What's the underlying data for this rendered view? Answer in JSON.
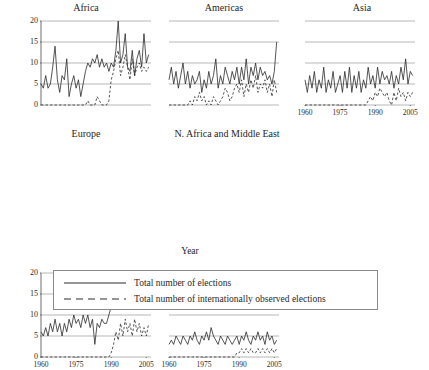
{
  "figure": {
    "xlabel": "Year",
    "panel_titles": [
      "Africa",
      "Americas",
      "Asia",
      "Europe",
      "N. Africa and Middle East"
    ]
  },
  "legend": {
    "items": [
      {
        "label": "Total number of elections",
        "style": "solid",
        "key": "solid-line-key"
      },
      {
        "label": "Total number of internationally observed elections",
        "style": "dashed",
        "key": "dashed-line-key"
      }
    ]
  },
  "chart_data": {
    "type": "line",
    "title": "",
    "subtitle": "",
    "xlabel": "Year",
    "ylabel": "",
    "xlim": [
      1960,
      2007
    ],
    "ylim": [
      0,
      20
    ],
    "xticks": [
      1960,
      1975,
      1990,
      2005
    ],
    "yticks": [
      0,
      5,
      10,
      15,
      20
    ],
    "grid": "horizontal",
    "legend_position": "bottom",
    "legend_entries": [
      "Total number of elections",
      "Total number of internationally observed elections"
    ],
    "panels": [
      {
        "name": "Africa",
        "row": 0,
        "col": 0,
        "show_yticklabels": true,
        "show_xticklabels": false,
        "x": [
          1960,
          1961,
          1962,
          1963,
          1964,
          1965,
          1966,
          1967,
          1968,
          1969,
          1970,
          1971,
          1972,
          1973,
          1974,
          1975,
          1976,
          1977,
          1978,
          1979,
          1980,
          1981,
          1982,
          1983,
          1984,
          1985,
          1986,
          1987,
          1988,
          1989,
          1990,
          1991,
          1992,
          1993,
          1994,
          1995,
          1996,
          1997,
          1998,
          1999,
          2000,
          2001,
          2002,
          2003,
          2004,
          2005,
          2006
        ],
        "series": [
          {
            "name": "Total number of elections",
            "style": "solid",
            "values": [
              5,
              4,
              7,
              4,
              5,
              9,
              14,
              6,
              3,
              7,
              6,
              11,
              2,
              5,
              7,
              4,
              6,
              2,
              5,
              8,
              10,
              9,
              11,
              10,
              12,
              9,
              11,
              9,
              10,
              8,
              10,
              9,
              13,
              20,
              10,
              12,
              17,
              9,
              8,
              13,
              7,
              11,
              13,
              9,
              17,
              10,
              12
            ]
          },
          {
            "name": "Total number of internationally observed elections",
            "style": "dashed",
            "values": [
              0,
              0,
              0,
              0,
              0,
              0,
              0,
              0,
              0,
              0,
              0,
              0,
              0,
              0,
              0,
              0,
              0,
              0,
              0,
              0,
              1,
              0,
              0,
              0,
              2,
              1,
              0,
              0,
              0,
              1,
              6,
              8,
              11,
              13,
              7,
              9,
              12,
              9,
              6,
              11,
              7,
              9,
              10,
              8,
              9,
              8,
              9
            ]
          }
        ]
      },
      {
        "name": "Americas",
        "row": 0,
        "col": 1,
        "show_yticklabels": false,
        "show_xticklabels": false,
        "x": [
          1960,
          1961,
          1962,
          1963,
          1964,
          1965,
          1966,
          1967,
          1968,
          1969,
          1970,
          1971,
          1972,
          1973,
          1974,
          1975,
          1976,
          1977,
          1978,
          1979,
          1980,
          1981,
          1982,
          1983,
          1984,
          1985,
          1986,
          1987,
          1988,
          1989,
          1990,
          1991,
          1992,
          1993,
          1994,
          1995,
          1996,
          1997,
          1998,
          1999,
          2000,
          2001,
          2002,
          2003,
          2004,
          2005,
          2006
        ],
        "series": [
          {
            "name": "Total number of elections",
            "style": "solid",
            "values": [
              6,
              9,
              5,
              8,
              4,
              7,
              10,
              5,
              8,
              4,
              7,
              5,
              6,
              8,
              3,
              6,
              4,
              8,
              5,
              7,
              11,
              4,
              7,
              5,
              9,
              7,
              5,
              8,
              6,
              9,
              5,
              9,
              6,
              11,
              5,
              9,
              7,
              10,
              6,
              9,
              7,
              8,
              6,
              7,
              5,
              8,
              15
            ]
          },
          {
            "name": "Total number of internationally observed elections",
            "style": "dashed",
            "values": [
              0,
              0,
              0,
              0,
              0,
              0,
              0,
              0,
              0,
              1,
              0,
              2,
              1,
              3,
              1,
              2,
              0,
              1,
              0,
              2,
              1,
              0,
              1,
              2,
              4,
              3,
              1,
              2,
              4,
              5,
              3,
              6,
              2,
              5,
              3,
              6,
              4,
              7,
              3,
              5,
              4,
              6,
              3,
              5,
              2,
              6,
              3
            ]
          }
        ]
      },
      {
        "name": "Asia",
        "row": 0,
        "col": 2,
        "show_yticklabels": false,
        "show_xticklabels": true,
        "x": [
          1960,
          1961,
          1962,
          1963,
          1964,
          1965,
          1966,
          1967,
          1968,
          1969,
          1970,
          1971,
          1972,
          1973,
          1974,
          1975,
          1976,
          1977,
          1978,
          1979,
          1980,
          1981,
          1982,
          1983,
          1984,
          1985,
          1986,
          1987,
          1988,
          1989,
          1990,
          1991,
          1992,
          1993,
          1994,
          1995,
          1996,
          1997,
          1998,
          1999,
          2000,
          2001,
          2002,
          2003,
          2004,
          2005,
          2006
        ],
        "series": [
          {
            "name": "Total number of elections",
            "style": "solid",
            "values": [
              6,
              3,
              7,
              4,
              8,
              3,
              6,
              4,
              9,
              3,
              6,
              4,
              8,
              3,
              5,
              7,
              3,
              8,
              4,
              9,
              3,
              7,
              4,
              8,
              3,
              6,
              4,
              9,
              5,
              7,
              4,
              9,
              5,
              8,
              6,
              7,
              5,
              8,
              4,
              7,
              5,
              9,
              6,
              11,
              5,
              8,
              7
            ]
          },
          {
            "name": "Total number of internationally observed elections",
            "style": "dashed",
            "values": [
              0,
              0,
              0,
              0,
              0,
              0,
              0,
              0,
              0,
              0,
              0,
              0,
              0,
              0,
              0,
              0,
              0,
              0,
              0,
              0,
              0,
              0,
              0,
              0,
              0,
              0,
              0,
              1,
              2,
              1,
              3,
              2,
              4,
              3,
              2,
              3,
              1,
              0,
              3,
              1,
              4,
              2,
              3,
              1,
              3,
              2,
              3
            ]
          }
        ]
      },
      {
        "name": "Europe",
        "row": 1,
        "col": 0,
        "show_yticklabels": true,
        "show_xticklabels": true,
        "x": [
          1960,
          1961,
          1962,
          1963,
          1964,
          1965,
          1966,
          1967,
          1968,
          1969,
          1970,
          1971,
          1972,
          1973,
          1974,
          1975,
          1976,
          1977,
          1978,
          1979,
          1980,
          1981,
          1982,
          1983,
          1984,
          1985,
          1986,
          1987,
          1988,
          1989,
          1990,
          1991,
          1992,
          1993,
          1994,
          1995,
          1996,
          1997,
          1998,
          1999,
          2000,
          2001,
          2002,
          2003,
          2004,
          2005,
          2006
        ],
        "series": [
          {
            "name": "Total number of elections",
            "style": "solid",
            "values": [
              6,
              5,
              7,
              5,
              8,
              6,
              9,
              6,
              8,
              5,
              8,
              6,
              9,
              7,
              10,
              8,
              9,
              7,
              10,
              8,
              10,
              7,
              9,
              3,
              8,
              7,
              9,
              8,
              8,
              10,
              12,
              15,
              16,
              14,
              17,
              15,
              17,
              15,
              16,
              18,
              15,
              17,
              14,
              16,
              13,
              14,
              15
            ]
          },
          {
            "name": "Total number of internationally observed elections",
            "style": "dashed",
            "values": [
              0,
              0,
              0,
              0,
              0,
              0,
              0,
              0,
              0,
              0,
              0,
              0,
              0,
              0,
              0,
              0,
              0,
              0,
              0,
              0,
              0,
              0,
              0,
              0,
              0,
              0,
              0,
              0,
              0,
              0,
              1,
              3,
              6,
              4,
              8,
              5,
              9,
              6,
              8,
              5,
              9,
              6,
              8,
              5,
              7,
              5,
              8
            ]
          }
        ]
      },
      {
        "name": "N. Africa and Middle East",
        "row": 1,
        "col": 1,
        "show_yticklabels": false,
        "show_xticklabels": true,
        "x": [
          1960,
          1961,
          1962,
          1963,
          1964,
          1965,
          1966,
          1967,
          1968,
          1969,
          1970,
          1971,
          1972,
          1973,
          1974,
          1975,
          1976,
          1977,
          1978,
          1979,
          1980,
          1981,
          1982,
          1983,
          1984,
          1985,
          1986,
          1987,
          1988,
          1989,
          1990,
          1991,
          1992,
          1993,
          1994,
          1995,
          1996,
          1997,
          1998,
          1999,
          2000,
          2001,
          2002,
          2003,
          2004,
          2005,
          2006
        ],
        "series": [
          {
            "name": "Total number of elections",
            "style": "solid",
            "values": [
              3,
              4,
              3,
              5,
              4,
              3,
              5,
              4,
              3,
              5,
              4,
              6,
              4,
              3,
              5,
              4,
              6,
              4,
              7,
              5,
              4,
              3,
              5,
              4,
              3,
              5,
              4,
              3,
              4,
              5,
              3,
              5,
              4,
              6,
              4,
              3,
              5,
              4,
              6,
              4,
              5,
              3,
              6,
              4,
              5,
              3,
              4
            ]
          },
          {
            "name": "Total number of internationally observed elections",
            "style": "dashed",
            "values": [
              0,
              0,
              0,
              0,
              0,
              0,
              0,
              0,
              0,
              0,
              0,
              0,
              0,
              0,
              0,
              0,
              0,
              0,
              0,
              0,
              0,
              0,
              0,
              0,
              0,
              0,
              0,
              0,
              0,
              1,
              1,
              2,
              1,
              2,
              1,
              2,
              1,
              1,
              2,
              1,
              2,
              1,
              2,
              1,
              2,
              1,
              2
            ]
          }
        ]
      }
    ]
  },
  "style": {
    "line_color": "#2a2a2a",
    "grid_color": "#9a9a9a",
    "axis_color": "#4a4a4a",
    "legend_border": "#8a8a8a"
  }
}
